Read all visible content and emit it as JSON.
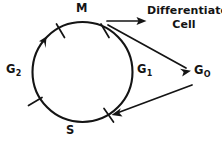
{
  "diagram": {
    "type": "cycle-with-exit",
    "labels": {
      "mitosis": "M",
      "gap_two": "G",
      "gap_two_sub": "2",
      "gap_one": "G",
      "gap_one_sub": "1",
      "gap_zero": "G",
      "gap_zero_sub": "O",
      "synthesis": "S",
      "differentiated_cell": "Differentiated Cell"
    },
    "phases": [
      {
        "name": "M",
        "description": "Mitosis"
      },
      {
        "name": "G1",
        "description": "Gap 1"
      },
      {
        "name": "S",
        "description": "Synthesis"
      },
      {
        "name": "G2",
        "description": "Gap 2"
      }
    ],
    "exits": [
      {
        "from": "G1",
        "to": "Differentiated Cell",
        "style": "horizontal-arrow"
      },
      {
        "from": "G1",
        "to": "GO",
        "style": "diagonal-arrow"
      },
      {
        "from": "GO",
        "to": "S-G1 boundary",
        "style": "return-arrow"
      }
    ],
    "colors": {
      "stroke": "#141414",
      "background": "#ffffff"
    },
    "geometry": {
      "center_x": 82.5,
      "center_y": 72,
      "radius": 50,
      "rotation_direction": "clockwise"
    }
  }
}
